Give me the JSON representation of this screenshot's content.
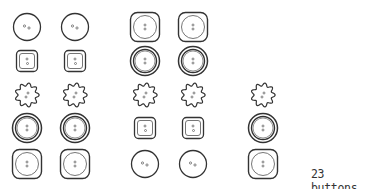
{
  "count_label": "23 buttons",
  "colors": {
    "stroke": "#333333",
    "inner_stroke": "#666666",
    "background": "#ffffff"
  },
  "buttons": [
    {
      "col": 1,
      "row": 1,
      "type": "round-two-hole",
      "cx": 27,
      "cy": 27
    },
    {
      "col": 1,
      "row": 2,
      "type": "square-small",
      "cx": 27,
      "cy": 61
    },
    {
      "col": 1,
      "row": 3,
      "type": "flower",
      "cx": 27,
      "cy": 95
    },
    {
      "col": 1,
      "row": 4,
      "type": "double-ring",
      "cx": 27,
      "cy": 128
    },
    {
      "col": 1,
      "row": 5,
      "type": "rounded-square-large",
      "cx": 27,
      "cy": 164
    },
    {
      "col": 2,
      "row": 1,
      "type": "round-two-hole",
      "cx": 75,
      "cy": 27
    },
    {
      "col": 2,
      "row": 2,
      "type": "square-small",
      "cx": 75,
      "cy": 61
    },
    {
      "col": 2,
      "row": 3,
      "type": "flower",
      "cx": 75,
      "cy": 95
    },
    {
      "col": 2,
      "row": 4,
      "type": "double-ring",
      "cx": 75,
      "cy": 128
    },
    {
      "col": 2,
      "row": 5,
      "type": "rounded-square-large",
      "cx": 75,
      "cy": 164
    },
    {
      "col": 3,
      "row": 1,
      "type": "rounded-square-large",
      "cx": 145,
      "cy": 27
    },
    {
      "col": 3,
      "row": 2,
      "type": "double-ring",
      "cx": 145,
      "cy": 61
    },
    {
      "col": 3,
      "row": 3,
      "type": "flower",
      "cx": 145,
      "cy": 95
    },
    {
      "col": 3,
      "row": 4,
      "type": "square-small",
      "cx": 145,
      "cy": 128
    },
    {
      "col": 3,
      "row": 5,
      "type": "round-two-hole",
      "cx": 145,
      "cy": 164
    },
    {
      "col": 4,
      "row": 1,
      "type": "rounded-square-large",
      "cx": 193,
      "cy": 27
    },
    {
      "col": 4,
      "row": 2,
      "type": "double-ring",
      "cx": 193,
      "cy": 61
    },
    {
      "col": 4,
      "row": 3,
      "type": "flower",
      "cx": 193,
      "cy": 95
    },
    {
      "col": 4,
      "row": 4,
      "type": "square-small",
      "cx": 193,
      "cy": 128
    },
    {
      "col": 4,
      "row": 5,
      "type": "round-two-hole",
      "cx": 193,
      "cy": 164
    },
    {
      "col": 5,
      "row": 3,
      "type": "flower",
      "cx": 263,
      "cy": 95
    },
    {
      "col": 5,
      "row": 4,
      "type": "double-ring",
      "cx": 263,
      "cy": 128
    },
    {
      "col": 5,
      "row": 5,
      "type": "rounded-square-large",
      "cx": 263,
      "cy": 164
    }
  ]
}
